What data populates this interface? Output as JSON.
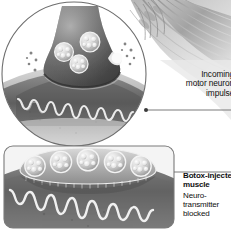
{
  "figure": {
    "type": "medical-illustration",
    "style": "grayscale",
    "colors": {
      "background": "#ffffff",
      "ink": "#0f0f0f",
      "outline": "#6e6e6e",
      "panel_border": "#7a7a7a",
      "leader_line": "#6b6b6b",
      "terminal_dark": "#4a4a4a",
      "terminal_mid": "#7b7b7b",
      "membrane_light": "#e8e8e8",
      "muscle_gray": "#9a9a9a",
      "vesicle_fill": "#cfcfcf"
    }
  },
  "callouts": {
    "impulse": {
      "lines": [
        "Incoming",
        "motor neuron",
        "impulse"
      ],
      "weight": "regular",
      "align": "right",
      "clipped_at_right_edge": true
    },
    "botox": {
      "title_lines": [
        "Botox-injected",
        "muscle"
      ],
      "body_lines": [
        "Neuro-",
        "transmitter",
        "blocked"
      ],
      "title_weight": "bold",
      "body_weight": "regular",
      "align": "left"
    }
  },
  "panels": {
    "magnifier": {
      "shape": "circle",
      "label": "synaptic-terminal-magnified",
      "cx": 74,
      "cy": 74,
      "r": 72
    },
    "inset": {
      "shape": "rounded-rectangle",
      "label": "botox-blocked-junction",
      "x": 4,
      "y": 146,
      "width": 170,
      "height": 82,
      "radius": 9
    }
  },
  "anatomy": {
    "axon_terminal": "axon terminal (synaptic bouton)",
    "vesicles_magnified_count": 3,
    "vesicles_inset_count": 5,
    "neurotransmitter_dots": "scattered free neurotransmitter molecules",
    "junctional_folds": "folded post-synaptic muscle membrane",
    "muscle_fibers": "striated muscle fiber bundle"
  }
}
